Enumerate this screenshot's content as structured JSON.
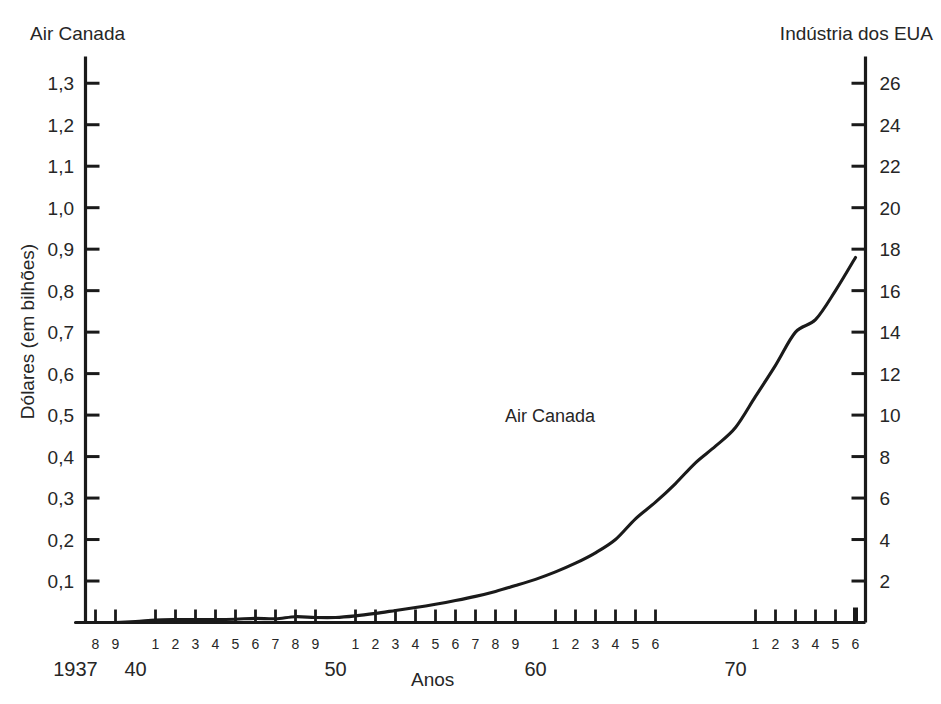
{
  "figure": {
    "caption_left": "Air Canada",
    "caption_right": "Indústria dos EUA",
    "series_label": "Air Canada",
    "xlabel": "Anos",
    "ylabel_left": "Dólares (em bilhões)",
    "background_color": "#ffffff",
    "line_color": "#1a1a1a"
  },
  "chart_data": {
    "type": "line",
    "title": "Air Canada",
    "subtitle": "Indústria dos EUA",
    "xlabel": "Anos",
    "ylabel": "Dólares (em bilhões)",
    "ylabel_right": "Indústria dos EUA",
    "grid": false,
    "legend": "in-plot series label at 1958",
    "xlim": [
      1937.5,
      1976.5
    ],
    "ylim": [
      0,
      1.35
    ],
    "ylim_right": [
      0,
      27
    ],
    "y_ticks_left": [
      "0,1",
      "0,2",
      "0,3",
      "0,4",
      "0,5",
      "0,6",
      "0,7",
      "0,8",
      "0,9",
      "1,0",
      "1,1",
      "1,2",
      "1,3"
    ],
    "y_tick_values_left": [
      0.1,
      0.2,
      0.3,
      0.4,
      0.5,
      0.6,
      0.7,
      0.8,
      0.9,
      1.0,
      1.1,
      1.2,
      1.3
    ],
    "y_ticks_right": [
      "2",
      "4",
      "6",
      "8",
      "10",
      "12",
      "14",
      "16",
      "18",
      "20",
      "22",
      "24",
      "26"
    ],
    "y_tick_values_right": [
      2,
      4,
      6,
      8,
      10,
      12,
      14,
      16,
      18,
      20,
      22,
      24,
      26
    ],
    "x_tick_labels": [
      "8",
      "9",
      "1",
      "2",
      "3",
      "4",
      "5",
      "6",
      "7",
      "8",
      "9",
      "1",
      "2",
      "3",
      "4",
      "5",
      "6",
      "7",
      "8",
      "9",
      "1",
      "2",
      "3",
      "4",
      "5",
      "6",
      "7",
      "8",
      "9",
      "1",
      "2",
      "3",
      "4",
      "5",
      "6"
    ],
    "x_tick_years": [
      1938,
      1939,
      1941,
      1942,
      1943,
      1944,
      1945,
      1946,
      1947,
      1948,
      1949,
      1951,
      1952,
      1953,
      1954,
      1955,
      1956,
      1957,
      1958,
      1959,
      1961,
      1962,
      1963,
      1964,
      1965,
      1966,
      1971,
      1972,
      1973,
      1974,
      1975,
      1976
    ],
    "x_decade_labels": [
      "1937",
      "40",
      "50",
      "60",
      "70"
    ],
    "x_decade_years": [
      1937,
      1940,
      1950,
      1960,
      1970
    ],
    "series": [
      {
        "name": "Air Canada",
        "unit": "Dólares (em bilhões)",
        "x": [
          1937,
          1938,
          1939,
          1940,
          1941,
          1942,
          1943,
          1944,
          1945,
          1946,
          1947,
          1948,
          1949,
          1950,
          1951,
          1952,
          1953,
          1954,
          1955,
          1956,
          1957,
          1958,
          1959,
          1960,
          1961,
          1962,
          1963,
          1964,
          1965,
          1966,
          1967,
          1968,
          1969,
          1970,
          1971,
          1972,
          1973,
          1974,
          1975,
          1976
        ],
        "values": [
          0.0,
          0.0,
          0.0,
          0.002,
          0.006,
          0.007,
          0.007,
          0.007,
          0.008,
          0.01,
          0.009,
          0.014,
          0.012,
          0.012,
          0.016,
          0.022,
          0.029,
          0.036,
          0.044,
          0.053,
          0.063,
          0.075,
          0.089,
          0.104,
          0.122,
          0.143,
          0.168,
          0.2,
          0.25,
          0.29,
          0.335,
          0.385,
          0.425,
          0.47,
          0.545,
          0.62,
          0.7,
          0.73,
          0.8,
          0.88
        ]
      }
    ],
    "annotations": [
      {
        "text": "Air Canada",
        "x": 1958,
        "y": 0.5
      }
    ]
  }
}
